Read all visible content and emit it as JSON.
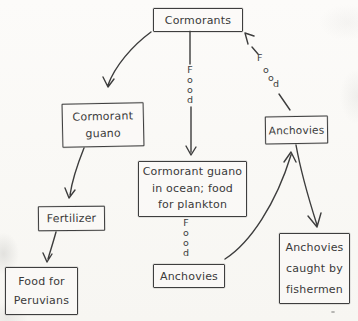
{
  "diagram": {
    "type": "hand-drawn food web / guano cycle flow chart",
    "ink_color": "#3d3d3d",
    "paper_color": "#fbfaf7",
    "nodes": {
      "cormorants": {
        "lines": [
          "Cormorants"
        ]
      },
      "cormorant_guano": {
        "lines": [
          "Cormorant",
          "guano"
        ]
      },
      "anchovies_right": {
        "lines": [
          "Anchovies"
        ]
      },
      "guano_ocean": {
        "lines": [
          "Cormorant guano",
          "in ocean; food",
          "for plankton"
        ]
      },
      "fertilizer": {
        "lines": [
          "Fertilizer"
        ]
      },
      "food_for_peruvians": {
        "lines": [
          "Food for",
          "Peruvians"
        ]
      },
      "anchovies_center": {
        "lines": [
          "Anchovies"
        ]
      },
      "anchovies_caught": {
        "lines": [
          "Anchovies",
          "caught by",
          "fishermen"
        ]
      }
    },
    "edge_labels": {
      "food": "Food",
      "food_letters": [
        "F",
        "o",
        "o",
        "d"
      ]
    },
    "edges": [
      {
        "from": "Cormorants",
        "to": "Cormorant guano",
        "label": ""
      },
      {
        "from": "Cormorants",
        "to": "Cormorant guano in ocean; food for plankton",
        "label": "Food"
      },
      {
        "from": "Anchovies (right)",
        "to": "Cormorants",
        "label": "Food"
      },
      {
        "from": "Cormorant guano in ocean; food for plankton",
        "to": "Anchovies (center)",
        "label": "Food"
      },
      {
        "from": "Cormorant guano",
        "to": "Fertilizer",
        "label": ""
      },
      {
        "from": "Fertilizer",
        "to": "Food for Peruvians",
        "label": ""
      },
      {
        "from": "Anchovies (center)",
        "to": "Anchovies (right)",
        "label": ""
      },
      {
        "from": "Anchovies (right)",
        "to": "Anchovies caught by fishermen",
        "label": ""
      }
    ]
  }
}
